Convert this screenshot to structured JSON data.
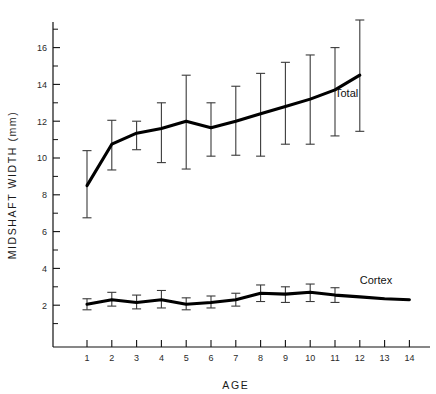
{
  "chart_data": {
    "type": "line",
    "title": "",
    "xlabel": "AGE",
    "ylabel": "MIDSHAFT WIDTH (mm)",
    "xlim": [
      0.3,
      14.7
    ],
    "ylim": [
      0,
      17.4
    ],
    "xticks": [
      1,
      2,
      3,
      4,
      5,
      6,
      7,
      8,
      9,
      10,
      11,
      12,
      13,
      14
    ],
    "xtick_labels": [
      "1",
      "2",
      "3",
      "4",
      "5",
      "6",
      "7",
      "8",
      "9",
      "10",
      "11",
      "12",
      "13",
      "14"
    ],
    "yticks": [
      2,
      4,
      6,
      8,
      10,
      12,
      14,
      16
    ],
    "ytick_labels": [
      "2",
      "4",
      "6",
      "8",
      "10",
      "12",
      "14",
      "16"
    ],
    "yticks_minor": [
      1,
      3,
      5,
      7,
      9,
      11,
      13,
      15,
      17
    ],
    "grid": false,
    "legend_position": "inline-right-of-curve",
    "error_bars": "vertical with caps",
    "series": [
      {
        "name": "Total",
        "label": "Total",
        "color": "#000000",
        "x": [
          1,
          2,
          3,
          4,
          5,
          6,
          7,
          8,
          9,
          10,
          11,
          12
        ],
        "values": [
          8.5,
          10.75,
          11.35,
          11.6,
          12.0,
          11.65,
          12.0,
          12.4,
          12.8,
          13.2,
          13.7,
          14.5
        ],
        "err_low": [
          6.75,
          9.35,
          10.45,
          9.75,
          9.4,
          10.1,
          10.15,
          10.1,
          10.75,
          10.75,
          11.2,
          11.45
        ],
        "err_high": [
          10.4,
          12.05,
          12.0,
          13.0,
          14.5,
          13.0,
          13.9,
          14.6,
          15.2,
          15.6,
          16.0,
          17.5
        ],
        "label_x": 11.0,
        "label_y": 13.3
      },
      {
        "name": "Cortex",
        "label": "Cortex",
        "color": "#000000",
        "x": [
          1,
          2,
          3,
          4,
          5,
          6,
          7,
          8,
          9,
          10,
          11,
          12,
          13,
          14
        ],
        "values": [
          2.05,
          2.3,
          2.15,
          2.3,
          2.05,
          2.15,
          2.3,
          2.65,
          2.6,
          2.7,
          2.55,
          2.45,
          2.35,
          2.3
        ],
        "err_low": [
          1.75,
          1.95,
          1.8,
          1.85,
          1.75,
          1.85,
          1.95,
          2.2,
          2.15,
          2.2,
          2.15,
          null,
          null,
          null
        ],
        "err_high": [
          2.35,
          2.7,
          2.55,
          2.8,
          2.4,
          2.5,
          2.65,
          3.1,
          3.0,
          3.15,
          2.95,
          null,
          null,
          null
        ],
        "label_x": 12.0,
        "label_y": 3.15
      }
    ]
  }
}
